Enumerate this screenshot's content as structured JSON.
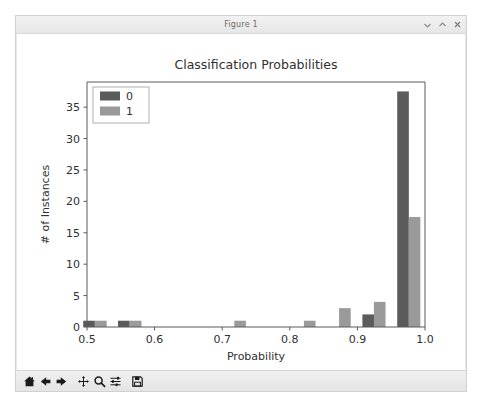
{
  "window": {
    "title": "Figure 1",
    "controls": [
      {
        "name": "minimize-button",
        "glyph": "minimize"
      },
      {
        "name": "maximize-button",
        "glyph": "maximize"
      },
      {
        "name": "close-button",
        "glyph": "close"
      }
    ]
  },
  "toolbar": {
    "buttons": [
      {
        "name": "home-button",
        "icon": "home-icon",
        "tooltip": "Reset original view"
      },
      {
        "name": "back-button",
        "icon": "arrow-left-icon",
        "tooltip": "Back to previous view"
      },
      {
        "name": "forward-button",
        "icon": "arrow-right-icon",
        "tooltip": "Forward to next view"
      },
      {
        "name": "pan-button",
        "icon": "move-cross-icon",
        "tooltip": "Pan axes with left mouse, zoom with right"
      },
      {
        "name": "zoom-button",
        "icon": "magnifier-icon",
        "tooltip": "Zoom to rectangle"
      },
      {
        "name": "configure-subplots-button",
        "icon": "sliders-icon",
        "tooltip": "Configure subplots"
      },
      {
        "name": "save-figure-button",
        "icon": "floppy-disk-icon",
        "tooltip": "Save the figure"
      }
    ]
  },
  "colors": {
    "series_0": "#5b5b5b",
    "series_1": "#9a9a9a",
    "axis": "#5a5a5a",
    "text": "#303030",
    "figure_background": "#ffffff",
    "legend_border": "#b0b0b0"
  },
  "chart_data": {
    "type": "bar",
    "title": "Classification Probabilities",
    "xlabel": "Probability",
    "ylabel": "# of Instances",
    "xlim": [
      0.5,
      1.0
    ],
    "ylim": [
      0,
      39
    ],
    "xticks": [
      "0.5",
      "0.6",
      "0.7",
      "0.8",
      "0.9",
      "1.0"
    ],
    "xtick_values": [
      0.5,
      0.6,
      0.7,
      0.8,
      0.9,
      1.0
    ],
    "yticks": [
      "0",
      "5",
      "10",
      "15",
      "20",
      "25",
      "30",
      "35"
    ],
    "ytick_values": [
      0,
      5,
      10,
      15,
      20,
      25,
      30,
      35
    ],
    "grid": false,
    "legend": {
      "position": "upper left",
      "entries": [
        "0",
        "1"
      ]
    },
    "bin_width": 0.0172,
    "series": [
      {
        "name": "0",
        "color": "#5b5b5b",
        "bars": [
          {
            "x": 0.503,
            "value": 1
          },
          {
            "x": 0.5545,
            "value": 1
          },
          {
            "x": 0.916,
            "value": 2
          },
          {
            "x": 0.9675,
            "value": 37.5
          }
        ]
      },
      {
        "name": "1",
        "color": "#9a9a9a",
        "bars": [
          {
            "x": 0.5205,
            "value": 1
          },
          {
            "x": 0.572,
            "value": 1
          },
          {
            "x": 0.7265,
            "value": 1
          },
          {
            "x": 0.8295,
            "value": 1
          },
          {
            "x": 0.8815,
            "value": 3
          },
          {
            "x": 0.933,
            "value": 4
          },
          {
            "x": 0.9845,
            "value": 17.5
          }
        ]
      }
    ]
  }
}
